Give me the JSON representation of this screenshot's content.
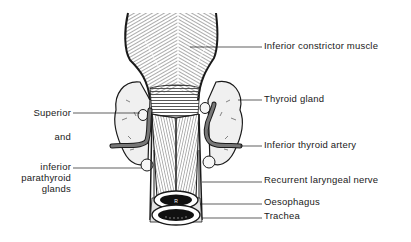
{
  "diagram": {
    "type": "anatomical illustration"
  },
  "labels": {
    "right": [
      {
        "id": "inferior-constrictor",
        "text": "Inferior constrictor muscle"
      },
      {
        "id": "thyroid-gland",
        "text": "Thyroid gland"
      },
      {
        "id": "inferior-thyroid-artery",
        "text": "Inferior thyroid artery"
      },
      {
        "id": "recurrent-laryngeal-nerve",
        "text": "Recurrent laryngeal nerve"
      },
      {
        "id": "oesophagus",
        "text": "Oesophagus"
      },
      {
        "id": "trachea",
        "text": "Trachea"
      }
    ],
    "left": [
      {
        "id": "superior",
        "text": "Superior"
      },
      {
        "id": "and",
        "text": "and"
      },
      {
        "id": "inferior-line1",
        "text": "inferior"
      },
      {
        "id": "inferior-line2",
        "text": "parathyroid"
      },
      {
        "id": "inferior-line3",
        "text": "glands"
      }
    ]
  },
  "colors": {
    "ink": "#1a1a1a",
    "muscle_fill": "#d8d8d8",
    "gland_fill": "#eeeeee",
    "artery_fill": "#555555",
    "background": "#ffffff"
  }
}
